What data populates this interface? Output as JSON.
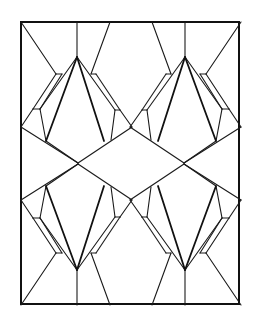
{
  "figure": {
    "title": "",
    "stroke_color": "#1a1a1a",
    "background": "#ffffff"
  }
}
